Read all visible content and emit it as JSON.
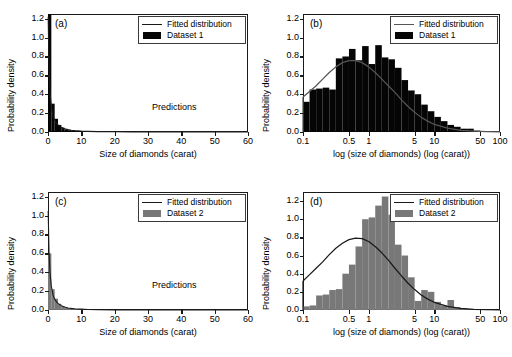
{
  "figure": {
    "axis_labels": {
      "y": "Probability density",
      "x_linear": "Size of diamonds (carat)",
      "x_log": "log (size of diamonds) (log (carat))"
    },
    "legend": {
      "fitted": "Fitted distribution",
      "dataset1": "Dataset 1",
      "dataset2": "Dataset 2"
    },
    "annotation_predictions": "Predictions",
    "colors": {
      "dataset1": "#050505",
      "dataset2": "#787878",
      "curve_dark": "#1a1a1a",
      "curve_gray": "#555555",
      "axis": "#1a1a1a"
    }
  },
  "chart_data": [
    {
      "id": "a",
      "panel_label": "(a)",
      "type": "bar",
      "title": "",
      "xlabel": "Size of diamonds (carat)",
      "ylabel": "Probability density",
      "xscale": "linear",
      "xlim": [
        0,
        60
      ],
      "ylim": [
        0,
        1.25
      ],
      "xticks": [
        0,
        10,
        20,
        30,
        40,
        50,
        60
      ],
      "yticks": [
        0.0,
        0.2,
        0.4,
        0.6,
        0.8,
        1.0,
        1.2
      ],
      "grid": false,
      "legend_position": "top-right",
      "legend_entries": [
        "Fitted distribution",
        "Dataset 1"
      ],
      "annotations": [
        "Predictions"
      ],
      "series": [
        {
          "name": "Dataset 1",
          "kind": "histogram",
          "color": "#050505",
          "bin_edges": [
            0,
            1,
            2,
            3,
            4,
            5,
            6,
            7,
            8,
            9,
            10,
            11,
            12,
            13,
            14,
            15,
            16,
            18,
            20,
            22,
            25,
            30,
            35,
            40,
            45,
            50,
            55,
            60
          ],
          "values": [
            1.25,
            0.3,
            0.14,
            0.075,
            0.045,
            0.028,
            0.019,
            0.013,
            0.01,
            0.008,
            0.006,
            0.005,
            0.004,
            0.003,
            0.0025,
            0.002,
            0.0016,
            0.0012,
            0.0009,
            0.0007,
            0.0005,
            0.0003,
            0.0002,
            0.0001,
            0.0001,
            0.0,
            0.0
          ]
        },
        {
          "name": "Fitted distribution",
          "kind": "line",
          "color": "#1a1a1a",
          "x": [
            0.05,
            0.3,
            0.6,
            1,
            1.5,
            2,
            2.5,
            3,
            4,
            5,
            6,
            7,
            8,
            10,
            12,
            15,
            20,
            25,
            30,
            40,
            50,
            60
          ],
          "y": [
            1.22,
            0.7,
            0.42,
            0.27,
            0.17,
            0.125,
            0.095,
            0.075,
            0.05,
            0.034,
            0.025,
            0.019,
            0.015,
            0.01,
            0.007,
            0.004,
            0.002,
            0.0013,
            0.0008,
            0.0004,
            0.0002,
            0.0001
          ]
        }
      ]
    },
    {
      "id": "b",
      "panel_label": "(b)",
      "type": "bar",
      "title": "",
      "xlabel": "log (size of diamonds) (log (carat))",
      "ylabel": "Probability density",
      "xscale": "log",
      "xlim": [
        0.1,
        100
      ],
      "ylim": [
        0,
        1.25
      ],
      "xticks": [
        0.1,
        0.5,
        1,
        5,
        10,
        50,
        100
      ],
      "xticklabels": [
        "0.1",
        "0.5",
        "1",
        "5",
        "10",
        "50",
        "100"
      ],
      "yticks": [
        0.0,
        0.2,
        0.4,
        0.6,
        0.8,
        1.0,
        1.2
      ],
      "grid": false,
      "legend_position": "top-right",
      "legend_entries": [
        "Fitted distribution",
        "Dataset 1"
      ],
      "series": [
        {
          "name": "Dataset 1",
          "kind": "histogram",
          "color": "#050505",
          "note": "bars in equal log-spaced bins from 0.1 to 100",
          "bin_log_edges": [
            -1.0,
            -0.9,
            -0.8,
            -0.7,
            -0.6,
            -0.5,
            -0.4,
            -0.3,
            -0.2,
            -0.1,
            0.0,
            0.1,
            0.2,
            0.3,
            0.4,
            0.5,
            0.6,
            0.7,
            0.8,
            0.9,
            1.0,
            1.1,
            1.2,
            1.3,
            1.4,
            1.5,
            1.6,
            1.7,
            1.8,
            1.9,
            2.0
          ],
          "values": [
            0.32,
            0.45,
            0.46,
            0.47,
            0.45,
            0.78,
            0.8,
            0.88,
            0.76,
            0.91,
            0.72,
            0.92,
            0.79,
            0.77,
            0.68,
            0.55,
            0.44,
            0.4,
            0.29,
            0.22,
            0.16,
            0.115,
            0.075,
            0.055,
            0.035,
            0.035,
            0.015,
            0.0,
            0.0,
            0.0
          ]
        },
        {
          "name": "Fitted distribution",
          "kind": "line",
          "color": "#555555",
          "x_log": [
            -1.0,
            -0.9,
            -0.8,
            -0.7,
            -0.6,
            -0.5,
            -0.4,
            -0.3,
            -0.2,
            -0.1,
            0.0,
            0.1,
            0.2,
            0.3,
            0.4,
            0.5,
            0.6,
            0.7,
            0.8,
            0.9,
            1.0,
            1.2,
            1.4,
            1.6,
            1.8,
            2.0
          ],
          "y": [
            0.37,
            0.43,
            0.49,
            0.56,
            0.63,
            0.69,
            0.735,
            0.757,
            0.757,
            0.735,
            0.69,
            0.63,
            0.56,
            0.49,
            0.42,
            0.34,
            0.27,
            0.21,
            0.155,
            0.115,
            0.08,
            0.04,
            0.018,
            0.008,
            0.003,
            0.001
          ]
        }
      ]
    },
    {
      "id": "c",
      "panel_label": "(c)",
      "type": "bar",
      "title": "",
      "xlabel": "Size of diamonds (carat)",
      "ylabel": "Probability density",
      "xscale": "linear",
      "xlim": [
        0,
        60
      ],
      "ylim": [
        0,
        1.25
      ],
      "xticks": [
        0,
        10,
        20,
        30,
        40,
        50,
        60
      ],
      "yticks": [
        0.0,
        0.2,
        0.4,
        0.6,
        0.8,
        1.0,
        1.2
      ],
      "grid": false,
      "legend_position": "top-right",
      "legend_entries": [
        "Fitted distribution",
        "Dataset 2"
      ],
      "annotations": [
        "Predictions"
      ],
      "series": [
        {
          "name": "Dataset 2",
          "kind": "histogram",
          "color": "#787878",
          "bin_edges": [
            0,
            1,
            2,
            3,
            4,
            5,
            6,
            7,
            8,
            9,
            10,
            11,
            12,
            13,
            14,
            15,
            16,
            18,
            20,
            22,
            25,
            30,
            35,
            40,
            45,
            50,
            55,
            60
          ],
          "values": [
            0.6,
            0.22,
            0.12,
            0.065,
            0.04,
            0.026,
            0.018,
            0.013,
            0.009,
            0.007,
            0.005,
            0.004,
            0.003,
            0.0025,
            0.002,
            0.0016,
            0.0013,
            0.001,
            0.0008,
            0.0006,
            0.0004,
            0.0002,
            0.0001,
            0.0001,
            0.0,
            0.0,
            0.0
          ]
        },
        {
          "name": "Fitted distribution",
          "kind": "line",
          "color": "#1a1a1a",
          "x": [
            0.05,
            0.3,
            0.6,
            1,
            1.5,
            2,
            2.5,
            3,
            4,
            5,
            6,
            7,
            8,
            10,
            12,
            15,
            20,
            25,
            30,
            40,
            50,
            60
          ],
          "y": [
            1.05,
            0.62,
            0.4,
            0.25,
            0.16,
            0.115,
            0.088,
            0.07,
            0.046,
            0.031,
            0.022,
            0.017,
            0.013,
            0.009,
            0.006,
            0.0035,
            0.0018,
            0.0011,
            0.0007,
            0.0003,
            0.0002,
            0.0001
          ]
        }
      ]
    },
    {
      "id": "d",
      "panel_label": "(d)",
      "type": "bar",
      "title": "",
      "xlabel": "log (size of diamonds) (log (carat))",
      "ylabel": "Probability density",
      "xscale": "log",
      "xlim": [
        0.1,
        100
      ],
      "ylim": [
        0,
        1.3
      ],
      "xticks": [
        0.1,
        0.5,
        1,
        5,
        10,
        50,
        100
      ],
      "xticklabels": [
        "0.1",
        "0.5",
        "1",
        "5",
        "10",
        "50",
        "100"
      ],
      "yticks": [
        0.0,
        0.2,
        0.4,
        0.6,
        0.8,
        1.0,
        1.2
      ],
      "grid": false,
      "legend_position": "top-right",
      "legend_entries": [
        "Fitted distribution",
        "Dataset 2"
      ],
      "series": [
        {
          "name": "Dataset 2",
          "kind": "histogram",
          "color": "#787878",
          "bin_log_edges": [
            -1.0,
            -0.9,
            -0.8,
            -0.7,
            -0.6,
            -0.5,
            -0.4,
            -0.3,
            -0.2,
            -0.1,
            0.0,
            0.1,
            0.2,
            0.3,
            0.4,
            0.5,
            0.6,
            0.7,
            0.8,
            0.9,
            1.0,
            1.1,
            1.2,
            1.3,
            1.4,
            1.5,
            1.6,
            1.7,
            1.8,
            1.9,
            2.0
          ],
          "values": [
            0.04,
            0.05,
            0.16,
            0.17,
            0.22,
            0.23,
            0.4,
            0.5,
            0.7,
            1.0,
            1.02,
            1.15,
            1.25,
            1.05,
            0.72,
            0.6,
            0.36,
            0.1,
            0.22,
            0.2,
            0.09,
            0.05,
            0.11,
            0.03,
            0.02,
            0.01,
            0.0,
            0.0,
            0.0,
            0.0
          ]
        },
        {
          "name": "Fitted distribution",
          "kind": "line",
          "color": "#1a1a1a",
          "x_log": [
            -1.0,
            -0.9,
            -0.8,
            -0.7,
            -0.6,
            -0.5,
            -0.4,
            -0.3,
            -0.2,
            -0.1,
            0.0,
            0.1,
            0.2,
            0.3,
            0.4,
            0.5,
            0.6,
            0.7,
            0.8,
            0.9,
            1.0,
            1.2,
            1.4,
            1.6,
            1.8,
            2.0
          ],
          "y": [
            0.32,
            0.39,
            0.46,
            0.53,
            0.61,
            0.68,
            0.735,
            0.775,
            0.793,
            0.787,
            0.755,
            0.7,
            0.63,
            0.55,
            0.46,
            0.375,
            0.295,
            0.225,
            0.165,
            0.12,
            0.085,
            0.04,
            0.018,
            0.007,
            0.003,
            0.001
          ]
        }
      ]
    }
  ]
}
